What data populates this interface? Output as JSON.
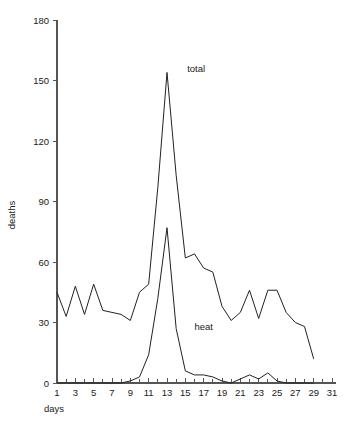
{
  "chart_data": {
    "type": "line",
    "title": "",
    "xlabel": "days",
    "ylabel": "deaths",
    "xlim": [
      0.5,
      31.5
    ],
    "ylim": [
      0,
      180
    ],
    "grid": false,
    "legend": "inline-annotations",
    "x": [
      1,
      2,
      3,
      4,
      5,
      6,
      7,
      8,
      9,
      10,
      11,
      12,
      13,
      14,
      15,
      16,
      17,
      18,
      19,
      20,
      21,
      22,
      23,
      24,
      25,
      26,
      27,
      28,
      29
    ],
    "xtick_values": [
      1,
      3,
      5,
      7,
      9,
      11,
      13,
      15,
      17,
      19,
      21,
      23,
      25,
      27,
      29,
      31
    ],
    "xtick_labels": [
      "1",
      "3",
      "5",
      "7",
      "9",
      "11",
      "13",
      "15",
      "17",
      "19",
      "21",
      "23",
      "25",
      "27",
      "29",
      "31"
    ],
    "xtick_minor_values": [
      2,
      4,
      6,
      8,
      10,
      12,
      14,
      16,
      18,
      20,
      22,
      24,
      26,
      28,
      30
    ],
    "ytick_values": [
      0,
      30,
      60,
      90,
      120,
      150,
      180
    ],
    "ytick_labels": [
      "0",
      "30",
      "60",
      "90",
      "120",
      "150",
      "180"
    ],
    "series": [
      {
        "name": "total",
        "label": "total",
        "label_x": 15.2,
        "label_y": 156,
        "values": [
          45,
          33,
          48,
          34,
          49,
          36,
          35,
          34,
          31,
          45,
          49,
          97,
          154,
          103,
          62,
          64,
          57,
          55,
          38,
          31,
          35,
          46,
          32,
          46,
          46,
          35,
          30,
          28,
          12
        ]
      },
      {
        "name": "heat",
        "label": "heat",
        "label_x": 16.0,
        "label_y": 28,
        "values": [
          0,
          0,
          0,
          0,
          0,
          0,
          0,
          0,
          1,
          3,
          14,
          42,
          77,
          27,
          6,
          4,
          4,
          3,
          1,
          0,
          2,
          4,
          2,
          5,
          1,
          0,
          0,
          0,
          0
        ]
      }
    ]
  }
}
